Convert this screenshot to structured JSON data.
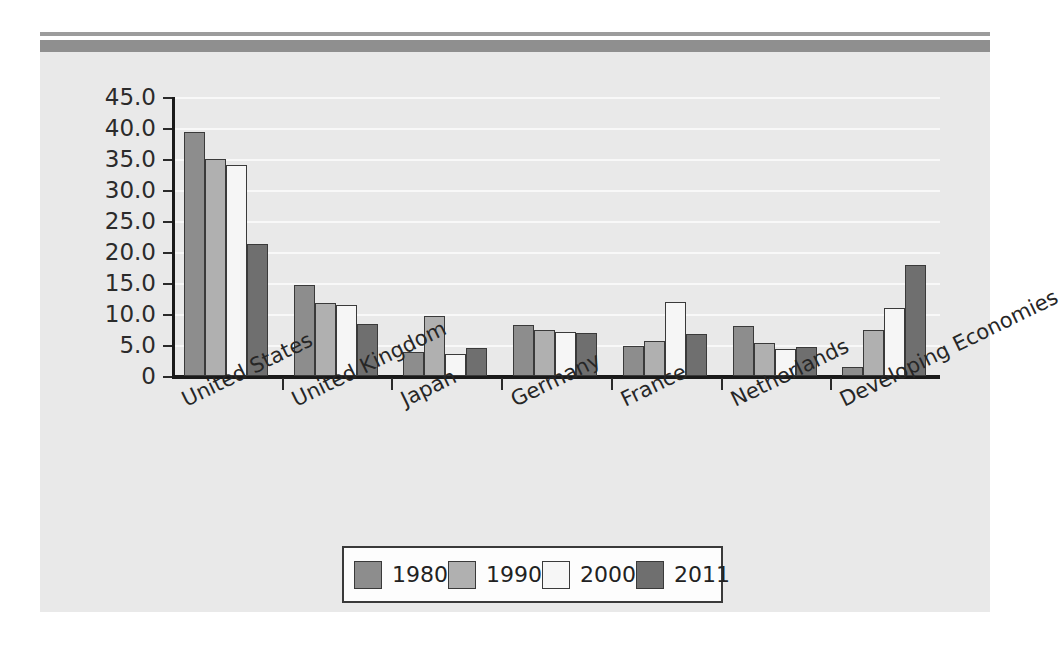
{
  "page": {
    "background_color": "#ffffff",
    "chart_background_color": "#e9e9e9",
    "rule_color": "#8f8f8f"
  },
  "chart_data": {
    "type": "bar",
    "title": "",
    "subtitle": "",
    "xlabel": "",
    "ylabel": "",
    "ylim": [
      0,
      45
    ],
    "ytick_labels": [
      "45.0",
      "40.0",
      "35.0",
      "30.0",
      "25.0",
      "20.0",
      "15.0",
      "10.0",
      "5.0",
      "0"
    ],
    "ytick_values": [
      45,
      40,
      35,
      30,
      25,
      20,
      15,
      10,
      5,
      0
    ],
    "grid": true,
    "grid_color": "#f8f8f8",
    "legend_position": "bottom",
    "categories": [
      "United States",
      "United Kingdom",
      "Japan",
      "Germany",
      "France",
      "Netherlands",
      "Developing Economies"
    ],
    "series": [
      {
        "name": "1980",
        "color": "#8d8d8d",
        "values": [
          39.3,
          14.7,
          3.8,
          8.2,
          4.8,
          8.0,
          1.5
        ]
      },
      {
        "name": "1990",
        "color": "#b0b0b0",
        "values": [
          35.0,
          11.8,
          9.7,
          7.5,
          5.6,
          5.3,
          7.4
        ]
      },
      {
        "name": "2000",
        "color": "#f6f6f6",
        "values": [
          34.0,
          11.5,
          3.6,
          7.1,
          11.9,
          4.3,
          11.0
        ]
      },
      {
        "name": "2011",
        "color": "#6f6f6f",
        "values": [
          21.3,
          8.4,
          4.5,
          6.9,
          6.7,
          4.6,
          17.9
        ]
      }
    ]
  },
  "legend": {
    "items": [
      {
        "label": "1980",
        "color": "#8d8d8d"
      },
      {
        "label": "1990",
        "color": "#b0b0b0"
      },
      {
        "label": "2000",
        "color": "#f6f6f6"
      },
      {
        "label": "2011",
        "color": "#6f6f6f"
      }
    ]
  }
}
